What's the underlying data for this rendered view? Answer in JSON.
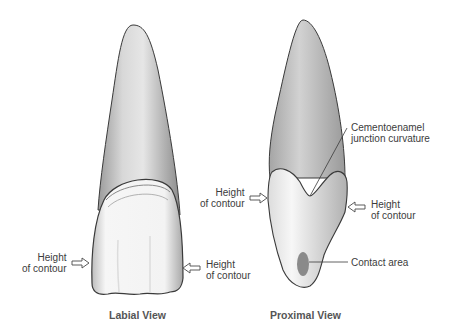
{
  "figure": {
    "views": [
      {
        "id": "labial",
        "caption": "Labial View",
        "labels": {
          "left_height": [
            "Height",
            "of contour"
          ],
          "right_height": [
            "Height",
            "of contour"
          ]
        }
      },
      {
        "id": "proximal",
        "caption": "Proximal View",
        "labels": {
          "cej": [
            "Cementoenamel",
            "junction curvature"
          ],
          "left_height": [
            "Height",
            "of contour"
          ],
          "right_height": [
            "Height",
            "of contour"
          ],
          "contact": "Contact area"
        }
      }
    ],
    "colors": {
      "outline": "#3a3a3a",
      "root_fill": "#c9c9c9",
      "crown_fill": "#f4f4f4",
      "contact_area": "#8a8a8a",
      "text": "#3c3c3c"
    }
  }
}
